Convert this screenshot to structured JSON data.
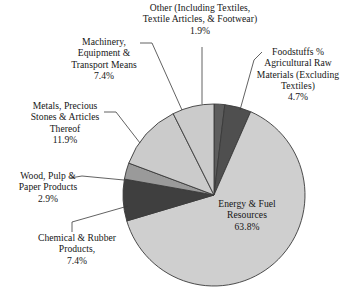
{
  "chart_data": {
    "type": "pie",
    "title": "",
    "subtitle": "",
    "xlabel": "",
    "ylabel": "",
    "legend_position": "callout-labels",
    "grid": false,
    "units": "percent",
    "start_angle_deg": 0,
    "direction": "clockwise",
    "categories": [
      "Other (Including Textiles, Textile Articles, & Footwear)",
      "Foodstuffs % Agricultural Raw Materials (Excluding Textiles)",
      "Energy & Fuel Resources",
      "Chemical & Rubber Products,",
      "Wood, Pulp & Paper Products",
      "Metals, Precious Stones & Articles Thereof",
      "Machinery, Equipment & Transport Means"
    ],
    "values": [
      1.9,
      4.7,
      63.8,
      7.4,
      2.9,
      11.9,
      7.4
    ],
    "colors": [
      "#5d5d5d",
      "#4f4f4f",
      "#cfcfcf",
      "#3f3f3f",
      "#9a9a9a",
      "#cbcbcb",
      "#cbcbcb"
    ],
    "slices": [
      {
        "name": "other",
        "label_lines": [
          "Other (Including Textiles,",
          "Textile Articles, & Footwear)"
        ],
        "percent_text": "1.9%",
        "value": 1.9,
        "color": "#5d5d5d"
      },
      {
        "name": "foodstuffs",
        "label_lines": [
          "Foodstuffs %",
          "Agricultural Raw",
          "Materials (Excluding",
          "Textiles)"
        ],
        "percent_text": "4.7%",
        "value": 4.7,
        "color": "#4f4f4f"
      },
      {
        "name": "energy-fuel",
        "label_lines": [
          "Energy & Fuel",
          "Resources"
        ],
        "percent_text": "63.8%",
        "value": 63.8,
        "color": "#cfcfcf"
      },
      {
        "name": "chemical-rubber",
        "label_lines": [
          "Chemical & Rubber",
          "Products,"
        ],
        "percent_text": "7.4%",
        "value": 7.4,
        "color": "#3f3f3f"
      },
      {
        "name": "wood-pulp-paper",
        "label_lines": [
          "Wood, Pulp &",
          "Paper Products"
        ],
        "percent_text": "2.9%",
        "value": 2.9,
        "color": "#9a9a9a"
      },
      {
        "name": "metals-precious-stones",
        "label_lines": [
          "Metals, Precious",
          "Stones & Articles",
          "Thereof"
        ],
        "percent_text": "11.9%",
        "value": 11.9,
        "color": "#cbcbcb"
      },
      {
        "name": "machinery-equipment",
        "label_lines": [
          "Machinery,",
          "Equipment &",
          "Transport Means"
        ],
        "percent_text": "7.4%",
        "value": 7.4,
        "color": "#cbcbcb"
      }
    ]
  },
  "labels": {
    "other": "Other (Including Textiles,\nTextile Articles, & Footwear)\n1.9%",
    "foodstuffs": "Foodstuffs %\nAgricultural Raw\nMaterials (Excluding\nTextiles)\n4.7%",
    "machinery": "Machinery,\nEquipment &\nTransport Means\n7.4%",
    "metals": "Metals, Precious\nStones & Articles\nThereof\n11.9%",
    "wood": "Wood, Pulp &\nPaper Products\n2.9%",
    "chemical": "Chemical & Rubber\nProducts,\n7.4%",
    "energy": "Energy & Fuel\nResources\n63.8%"
  },
  "style": {
    "background": "#ffffff",
    "outline": "#3a3a3a",
    "text": "#161616"
  }
}
